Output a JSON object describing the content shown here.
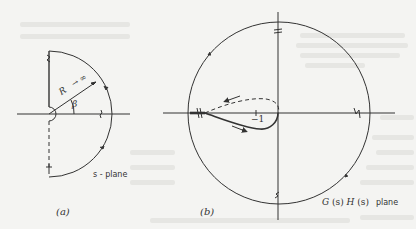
{
  "figure": {
    "panel_a": {
      "caption": "(a)",
      "plane_label": "s - plane",
      "radius_label": "R",
      "radius_limit": "→ ∞",
      "angle_label": "β"
    },
    "panel_b": {
      "caption": "(b)",
      "plane_label_g": "G",
      "plane_label_s1": "(s)",
      "plane_label_h": "H",
      "plane_label_s2": "(s)",
      "plane_word": "plane",
      "critical_point_label": "−1"
    },
    "colors": {
      "ink": "#333333",
      "background": "#f4f4f2",
      "bleed_through": "#e6e6e3"
    }
  }
}
